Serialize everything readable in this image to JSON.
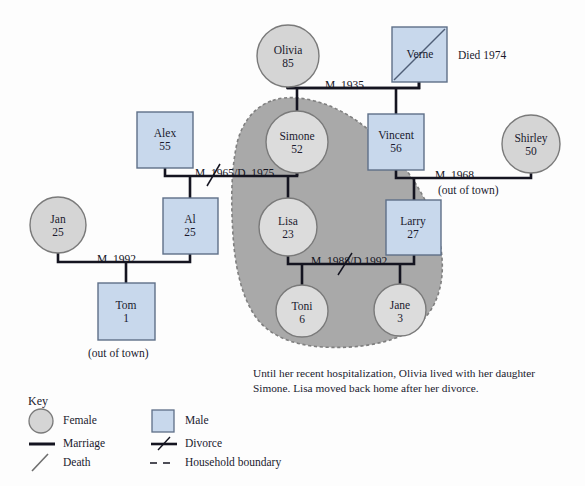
{
  "diagram": {
    "colors": {
      "male_fill": "#c8d8ec",
      "male_stroke": "#6b7c94",
      "female_fill": "#d5d5d5",
      "female_stroke": "#7a7a7a",
      "line": "#141420",
      "household_fill": "#a9a9a9",
      "household_stroke": "#8f8f8f",
      "text": "#1a1a2e"
    }
  },
  "people": [
    {
      "id": "olivia",
      "name": "Olivia",
      "age": "85",
      "sex": "female",
      "cx": 288,
      "cy": 56,
      "r": 31
    },
    {
      "id": "verne",
      "name": "Verne",
      "age": "",
      "sex": "male",
      "x": 392,
      "y": 27,
      "w": 55,
      "h": 55,
      "deceased": true
    },
    {
      "id": "alex",
      "name": "Alex",
      "age": "55",
      "sex": "male",
      "x": 137,
      "y": 112,
      "w": 56,
      "h": 56
    },
    {
      "id": "simone",
      "name": "Simone",
      "age": "52",
      "sex": "female",
      "cx": 297,
      "cy": 142,
      "r": 31
    },
    {
      "id": "vincent",
      "name": "Vincent",
      "age": "56",
      "sex": "male",
      "x": 368,
      "y": 114,
      "w": 56,
      "h": 56
    },
    {
      "id": "shirley",
      "name": "Shirley",
      "age": "50",
      "sex": "female",
      "cx": 531,
      "cy": 144,
      "r": 29
    },
    {
      "id": "jan",
      "name": "Jan",
      "age": "25",
      "sex": "female",
      "cx": 58,
      "cy": 225,
      "r": 28
    },
    {
      "id": "al",
      "name": "Al",
      "age": "25",
      "sex": "male",
      "x": 163,
      "y": 198,
      "w": 55,
      "h": 56
    },
    {
      "id": "lisa",
      "name": "Lisa",
      "age": "23",
      "sex": "female",
      "cx": 288,
      "cy": 227,
      "r": 29
    },
    {
      "id": "larry",
      "name": "Larry",
      "age": "27",
      "sex": "male",
      "x": 386,
      "y": 200,
      "w": 55,
      "h": 55
    },
    {
      "id": "tom",
      "name": "Tom",
      "age": "1",
      "sex": "male",
      "x": 98,
      "y": 283,
      "w": 57,
      "h": 57
    },
    {
      "id": "toni",
      "name": "Toni",
      "age": "6",
      "sex": "female",
      "cx": 302,
      "cy": 311,
      "r": 26
    },
    {
      "id": "jane",
      "name": "Jane",
      "age": "3",
      "sex": "female",
      "cx": 400,
      "cy": 310,
      "r": 26
    }
  ],
  "relationships": [
    {
      "id": "olivia-verne",
      "label": "M. 1935",
      "divorced": false
    },
    {
      "id": "alex-simone",
      "label": "M. 1965/D. 1975",
      "divorced": true
    },
    {
      "id": "vincent-shirley",
      "label": "M. 1968",
      "divorced": false,
      "note": "(out of town)"
    },
    {
      "id": "jan-al",
      "label": "M. 1992",
      "divorced": false
    },
    {
      "id": "lisa-larry",
      "label": "M. 1988/D.1992",
      "divorced": true
    }
  ],
  "annotations": {
    "verne_death": "Died 1974",
    "vincent_shirley_note": "(out of town)",
    "tom_note": "(out of town)",
    "caption_line1": "Until her recent hospitalization, Olivia lived with her daughter",
    "caption_line2": "Simone.  Lisa moved back home after her divorce."
  },
  "key": {
    "title": "Key",
    "items": [
      {
        "id": "female",
        "label": "Female",
        "glyph": "circle-icon"
      },
      {
        "id": "male",
        "label": "Male",
        "glyph": "square-icon"
      },
      {
        "id": "marriage",
        "label": "Marriage",
        "glyph": "solid-line-icon"
      },
      {
        "id": "divorce",
        "label": "Divorce",
        "glyph": "slashed-line-icon"
      },
      {
        "id": "death",
        "label": "Death",
        "glyph": "diagonal-slash-icon"
      },
      {
        "id": "household",
        "label": "Household boundary",
        "glyph": "dashed-line-icon"
      }
    ]
  }
}
